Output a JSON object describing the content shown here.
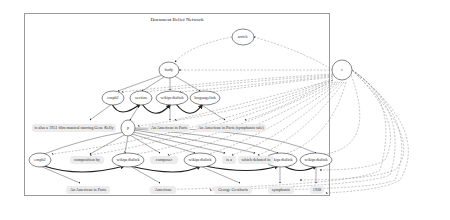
{
  "title": "Document Belief Network",
  "nodes": {
    "article": "article",
    "body": "body",
    "r": "r",
    "emph2_a": "emph2",
    "section": "section",
    "wikipedialink_a": "wikipedialink",
    "languagelink": "languagelink",
    "p": "p",
    "emph2_b": "emph2",
    "wikipedialink_b": "wikipedialink",
    "wikipedialink_c": "wikipedialink",
    "wikipedialink_d": "wikipedialink",
    "wikipedialink_e": "wikipedialink"
  },
  "leaves": {
    "gene_kelly": "is also a 1951 film musical starring Gene Kelly",
    "american_paris_1": "An American in Paris",
    "american_paris_syn": "An American in Paris (symphonic tale)",
    "composition_by": "composition by",
    "composer": "composer",
    "is_a": "is a",
    "which_debuted_in": "which debuted in",
    "american_paris_2": "An American in Paris",
    "american": "American",
    "george_gershwin": "George Gershwin",
    "symphonic": "symphonic",
    "year_1928": "1928"
  }
}
